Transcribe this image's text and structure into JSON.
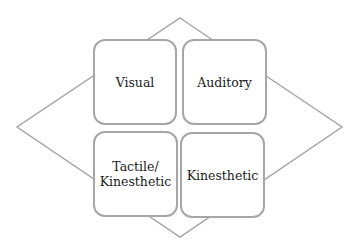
{
  "diagram": {
    "title": "",
    "quadrants": [
      {
        "id": "visual",
        "label": "Visual"
      },
      {
        "id": "auditory",
        "label": "Auditory"
      },
      {
        "id": "tactile-kinesthetic",
        "label": "Tactile/\nKinesthetic"
      },
      {
        "id": "kinesthetic",
        "label": "Kinesthetic"
      }
    ],
    "background_shape": "diamond",
    "colors": {
      "stroke": "#a6a6a6",
      "text": "#1a1a1a",
      "background": "#ffffff"
    }
  }
}
